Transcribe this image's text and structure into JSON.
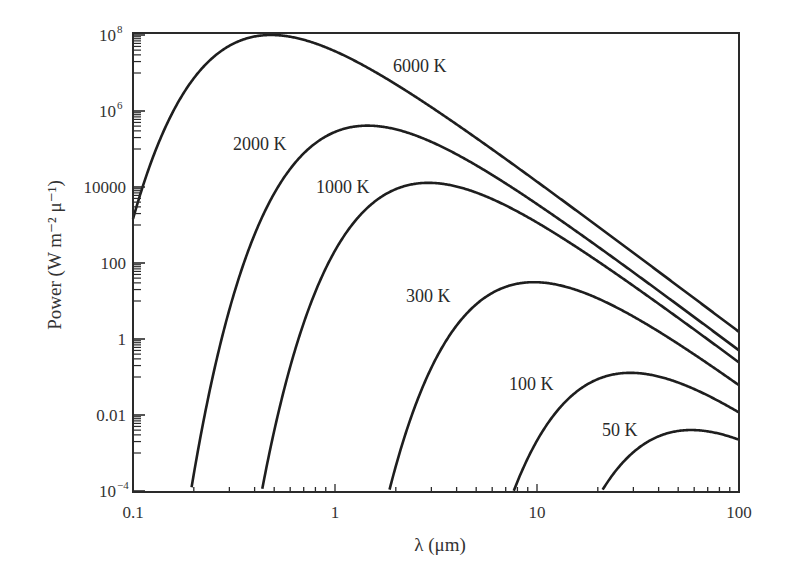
{
  "chart_data": {
    "type": "line",
    "title": "",
    "xlabel": "λ (μm)",
    "ylabel": "Power (W m⁻² μ⁻¹)",
    "xscale": "log",
    "yscale": "log",
    "xlim": [
      0.1,
      100
    ],
    "ylim": [
      0.0001,
      100000000
    ],
    "grid": false,
    "legend": "inline curve labels",
    "x_ticks": [
      {
        "value": 0.1,
        "label": "0.1"
      },
      {
        "value": 1,
        "label": "1"
      },
      {
        "value": 10,
        "label": "10"
      },
      {
        "value": 100,
        "label": "100"
      }
    ],
    "y_ticks": [
      {
        "value": 0.0001,
        "label": "10",
        "sup": "−4"
      },
      {
        "value": 0.01,
        "label": "0.01",
        "sup": ""
      },
      {
        "value": 1,
        "label": "1",
        "sup": ""
      },
      {
        "value": 100,
        "label": "100",
        "sup": ""
      },
      {
        "value": 10000,
        "label": "10000",
        "sup": ""
      },
      {
        "value": 1000000,
        "label": "10",
        "sup": "6"
      },
      {
        "value": 100000000,
        "label": "10",
        "sup": "8"
      }
    ],
    "series": [
      {
        "name": "6000 K",
        "temperature_K": 6000,
        "label_pos": [
          393,
          72
        ],
        "x": [
          0.1,
          0.483,
          1,
          10,
          100
        ],
        "values": [
          1440,
          100000000,
          37400000,
          13800,
          1.56
        ]
      },
      {
        "name": "2000 K",
        "temperature_K": 2000,
        "label_pos": [
          233,
          150
        ],
        "x": [
          0.2,
          1.449,
          10,
          100
        ],
        "values": [
          0.00028,
          412000,
          3550,
          0.52
        ]
      },
      {
        "name": "1000 K",
        "temperature_K": 1000,
        "label_pos": [
          316,
          193
        ],
        "x": [
          0.45,
          2.898,
          10,
          100
        ],
        "values": [
          0.0001,
          12900,
          1160,
          0.26
        ]
      },
      {
        "name": "300 K",
        "temperature_K": 300,
        "label_pos": [
          406,
          302
        ],
        "x": [
          2,
          9.66,
          100
        ],
        "values": [
          0.0001,
          31.3,
          0.0608
        ]
      },
      {
        "name": "100 K",
        "temperature_K": 100,
        "label_pos": [
          509,
          390
        ],
        "x": [
          7.5,
          28.98,
          100
        ],
        "values": [
          0.0001,
          0.129,
          0.0116
        ]
      },
      {
        "name": "50 K",
        "temperature_K": 50,
        "label_pos": [
          602,
          436
        ],
        "x": [
          21,
          57.96,
          100
        ],
        "values": [
          0.0001,
          0.004,
          0.00223
        ]
      }
    ],
    "curve_model": "Planck blackbody spectral exitance",
    "colors": {
      "line": "#1e1e1e",
      "axis": "#2a2a2a",
      "text": "#333333",
      "background": "#ffffff"
    }
  }
}
